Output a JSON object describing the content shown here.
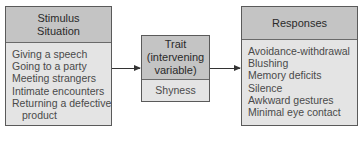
{
  "stimulus": {
    "title_line1": "Stimulus",
    "title_line2": "Situation",
    "items": [
      "Giving a speech",
      "Going to a party",
      "Meeting strangers",
      "Intimate encounters",
      "Returning a defective",
      "product"
    ]
  },
  "trait": {
    "title_line1": "Trait",
    "title_line2": "(intervening",
    "title_line3": "variable)",
    "value": "Shyness"
  },
  "responses": {
    "title": "Responses",
    "items": [
      "Avoidance-withdrawal",
      "Blushing",
      "Memory deficits",
      "Silence",
      "Awkward gestures",
      "Minimal eye contact"
    ]
  },
  "colors": {
    "header_fill": "#c4c4c4",
    "body_fill": "#e4e4e4",
    "border": "#5a5a5a"
  }
}
